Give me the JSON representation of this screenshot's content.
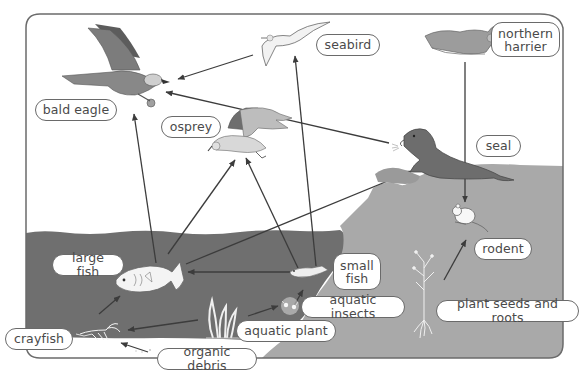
{
  "diagram": {
    "type": "food-web",
    "colors": {
      "frame": "#6b6b6b",
      "sky": "#ffffff",
      "water": "#6f6f6f",
      "land": "#a9a9a9",
      "arrow": "#3c3c3c",
      "label_border": "#6a6a6a",
      "label_text": "#4a4a4a"
    },
    "labels": {
      "bald_eagle": "bald eagle",
      "seabird": "seabird",
      "northern_harrier": "northern\nharrier",
      "osprey": "osprey",
      "seal": "seal",
      "large_fish": "large fish",
      "small_fish": "small\nfish",
      "rodent": "rodent",
      "aquatic_insects": "aquatic insects",
      "aquatic_plant": "aquatic plant",
      "plant_seeds_and_roots": "plant seeds and roots",
      "crayfish": "crayfish",
      "organic_debris": "organic debris"
    },
    "arrows": [
      {
        "from": "seabird",
        "to": "bald eagle"
      },
      {
        "from": "seal",
        "to": "bald eagle"
      },
      {
        "from": "large fish",
        "to": "bald eagle"
      },
      {
        "from": "large fish",
        "to": "osprey"
      },
      {
        "from": "small fish",
        "to": "osprey"
      },
      {
        "from": "small fish",
        "to": "seabird"
      },
      {
        "from": "large fish",
        "to": "seal"
      },
      {
        "from": "small fish",
        "to": "large fish"
      },
      {
        "from": "aquatic insects",
        "to": "small fish"
      },
      {
        "from": "aquatic plant",
        "to": "aquatic insects"
      },
      {
        "from": "aquatic plant",
        "to": "crayfish"
      },
      {
        "from": "crayfish",
        "to": "large fish"
      },
      {
        "from": "organic debris",
        "to": "crayfish"
      },
      {
        "from": "rodent",
        "to": "northern harrier"
      },
      {
        "from": "plant seeds and roots",
        "to": "rodent"
      }
    ]
  }
}
